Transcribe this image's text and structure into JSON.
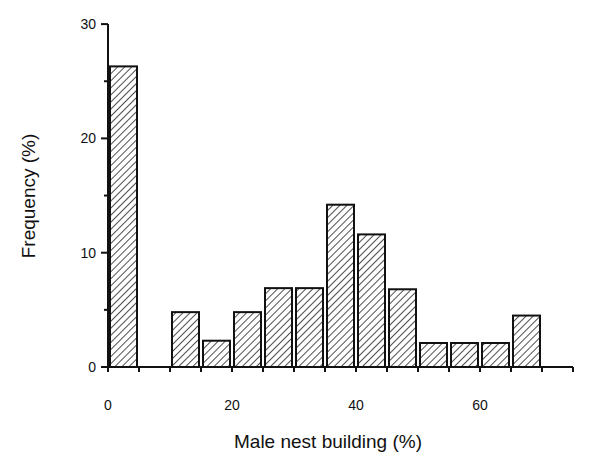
{
  "chart_data": {
    "type": "bar",
    "title": "",
    "xlabel": "Male nest building (%)",
    "ylabel": "Frequency (%)",
    "bin_width": 5,
    "bins": [
      {
        "x_start": 0,
        "x_end": 5,
        "value": 26.3
      },
      {
        "x_start": 10,
        "x_end": 15,
        "value": 4.8
      },
      {
        "x_start": 15,
        "x_end": 20,
        "value": 2.3
      },
      {
        "x_start": 20,
        "x_end": 25,
        "value": 4.8
      },
      {
        "x_start": 25,
        "x_end": 30,
        "value": 6.9
      },
      {
        "x_start": 30,
        "x_end": 35,
        "value": 6.9
      },
      {
        "x_start": 35,
        "x_end": 40,
        "value": 14.2
      },
      {
        "x_start": 40,
        "x_end": 45,
        "value": 11.6
      },
      {
        "x_start": 45,
        "x_end": 50,
        "value": 6.8
      },
      {
        "x_start": 50,
        "x_end": 55,
        "value": 2.1
      },
      {
        "x_start": 55,
        "x_end": 60,
        "value": 2.1
      },
      {
        "x_start": 60,
        "x_end": 65,
        "value": 2.1
      },
      {
        "x_start": 65,
        "x_end": 70,
        "value": 4.5
      }
    ],
    "categories": [
      "0-5",
      "10-15",
      "15-20",
      "20-25",
      "25-30",
      "30-35",
      "35-40",
      "40-45",
      "45-50",
      "50-55",
      "55-60",
      "60-65",
      "65-70"
    ],
    "values": [
      26.3,
      4.8,
      2.3,
      4.8,
      6.9,
      6.9,
      14.2,
      11.6,
      6.8,
      2.1,
      2.1,
      2.1,
      4.5
    ],
    "xlim": [
      0,
      75
    ],
    "ylim": [
      0,
      30
    ],
    "x_ticks": [
      "0",
      "20",
      "40",
      "60"
    ],
    "y_ticks": [
      "0",
      "10",
      "20",
      "30"
    ],
    "grid": false,
    "legend": null,
    "bar_fill": "diagonal hatch",
    "bar_color": "#111111"
  }
}
